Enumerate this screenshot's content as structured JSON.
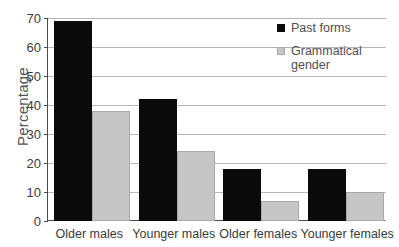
{
  "chart_data": {
    "type": "bar",
    "title": "",
    "xlabel": "",
    "ylabel": "Percentage",
    "ylim": [
      0,
      70
    ],
    "ytick_step": 10,
    "yticks": [
      0,
      10,
      20,
      30,
      40,
      50,
      60,
      70
    ],
    "grid": true,
    "legend_position": "top-right",
    "categories": [
      "Older males",
      "Younger males",
      "Older females",
      "Younger females"
    ],
    "series": [
      {
        "name": "Past forms",
        "color": "#0a0a0a",
        "values": [
          69,
          42,
          18,
          18
        ]
      },
      {
        "name": "Grammatical gender",
        "color": "#c6c6c6",
        "values": [
          38,
          24,
          7,
          10
        ]
      }
    ]
  }
}
